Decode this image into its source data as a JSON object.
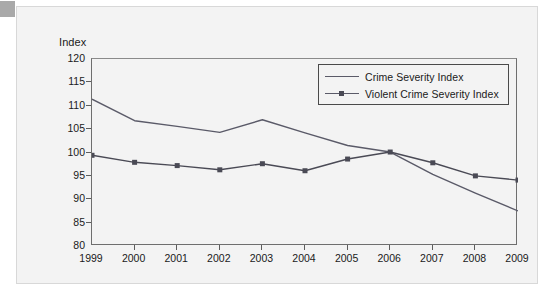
{
  "figure": {
    "y_axis_title": "Index",
    "corner_tab_color": "#a9a9a9",
    "panel_bg": "#f3f3f3",
    "axis_color": "#5d5d5d",
    "series_color_1": "#5a5a68",
    "series_color_2": "#4a4a55"
  },
  "legend": {
    "entries": [
      {
        "label": "Crime Severity Index",
        "marker": "none"
      },
      {
        "label": "Violent Crime Severity Index",
        "marker": "square"
      }
    ]
  },
  "chart_data": {
    "type": "line",
    "title": "",
    "xlabel": "",
    "ylabel": "Index",
    "ylim": [
      80,
      120
    ],
    "yticks": [
      80,
      85,
      90,
      95,
      100,
      105,
      110,
      115,
      120
    ],
    "ytick_labels": [
      "80",
      "85",
      "90",
      "95",
      "100",
      "105",
      "110",
      "115",
      "120"
    ],
    "grid": false,
    "legend_position": "upper right",
    "categories": [
      1999,
      2000,
      2001,
      2002,
      2003,
      2004,
      2005,
      2006,
      2007,
      2008,
      2009
    ],
    "xtick_labels": [
      "1999",
      "2000",
      "2001",
      "2002",
      "2003",
      "2004",
      "2005",
      "2006",
      "2007",
      "2008",
      "2009"
    ],
    "series": [
      {
        "name": "Crime Severity Index",
        "marker": "none",
        "values": [
          111.4,
          106.8,
          105.6,
          104.3,
          107.0,
          104.2,
          101.5,
          100.1,
          95.3,
          91.3,
          87.5
        ]
      },
      {
        "name": "Violent Crime Severity Index",
        "marker": "square",
        "values": [
          99.4,
          97.9,
          97.2,
          96.3,
          97.6,
          96.1,
          98.6,
          100.1,
          97.8,
          95.0,
          94.1
        ]
      }
    ]
  }
}
